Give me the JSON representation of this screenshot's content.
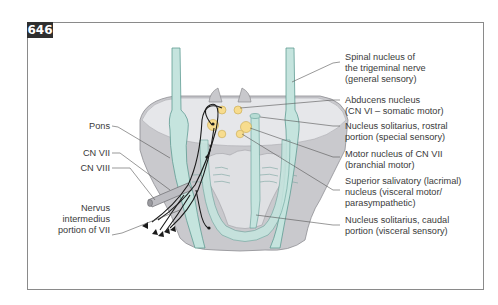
{
  "figure": {
    "number": "646",
    "colors": {
      "frame": "#8a8a8a",
      "badge_bg": "#2f2f2f",
      "pons_gray": "#c9c9cd",
      "pons_light": "#e6e7ea",
      "teal": "#c5e4de",
      "teal_stroke": "#5f9c93",
      "nucleus_yellow": "#f7dc8e",
      "nerve_black": "#1a1a1a",
      "leader_line": "#555555"
    }
  },
  "labels_left": [
    {
      "text": "Pons"
    },
    {
      "text": "CN VII"
    },
    {
      "text": "CN VIII"
    },
    {
      "line1": "Nervus",
      "line2": "intermedius",
      "line3": "portion of VII"
    }
  ],
  "labels_right": [
    {
      "line1": "Spinal nucleus of",
      "line2": "the trigeminal nerve",
      "line3": "(general sensory)"
    },
    {
      "line1": "Abducens nucleus",
      "line2": "(CN VI – somatic motor)"
    },
    {
      "line1": "Nucleus solitarius, rostral",
      "line2": "portion (special sensory)"
    },
    {
      "line1": "Motor nucleus of CN VII",
      "line2": "(branchial motor)"
    },
    {
      "line1": "Superior salivatory (lacrimal)",
      "line2": "nucleus (visceral motor/",
      "line3": "parasympathetic)"
    },
    {
      "line1": "Nucleus solitarius, caudal",
      "line2": "portion (visceral sensory)"
    }
  ]
}
